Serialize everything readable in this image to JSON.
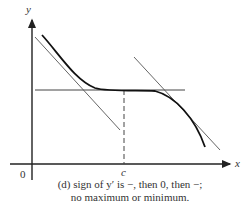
{
  "diagram": {
    "axis_labels": {
      "y": "y",
      "x": "x",
      "origin": "0",
      "c": "c"
    },
    "caption": {
      "line1": "(d) sign of y′ is −, then 0, then −;",
      "line2": "no maximum or minimum."
    }
  }
}
